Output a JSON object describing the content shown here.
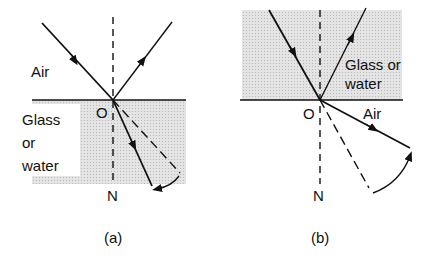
{
  "figure": {
    "panels": [
      {
        "id": "a",
        "caption": "(a)",
        "labels": {
          "upper_medium": "Air",
          "lower_medium_line1": "Glass",
          "lower_medium_line2": "or",
          "lower_medium_line3": "water",
          "point": "O",
          "normal": "N"
        }
      },
      {
        "id": "b",
        "caption": "(b)",
        "labels": {
          "upper_medium_line1": "Glass or",
          "upper_medium_line2": "water",
          "lower_medium": "Air",
          "point": "O",
          "normal": "N"
        }
      }
    ],
    "colors": {
      "ink": "#111111",
      "shade": "#d9d9d9",
      "background": "#ffffff"
    }
  }
}
